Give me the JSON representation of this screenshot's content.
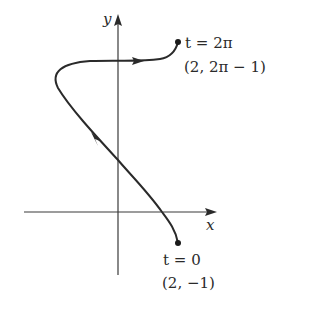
{
  "diagram": {
    "type": "parametric-curve",
    "axes": {
      "x_label": "x",
      "y_label": "y"
    },
    "start_point": {
      "param_label": "t = 0",
      "coords_label": "(2, −1)"
    },
    "end_point": {
      "param_label": "t = 2π",
      "coords_label": "(2, 2π − 1)"
    },
    "direction": "from t = 0 upward-left to leftmost turn, then right to t = 2π",
    "colors": {
      "curve": "#2a2a2a",
      "axes": "#3a3a3a",
      "background": "#ffffff"
    }
  }
}
